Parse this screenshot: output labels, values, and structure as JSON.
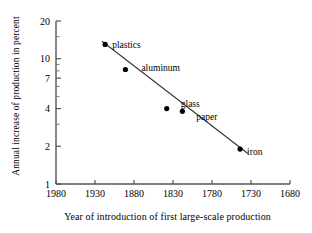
{
  "chart_data": {
    "type": "scatter",
    "title": "",
    "xlabel": "Year of introduction of first large-scale production",
    "ylabel": "Annual increase of production in percent",
    "xlim": [
      1980,
      1680
    ],
    "ylim": [
      1,
      20
    ],
    "yscale": "log",
    "xscale": "linear",
    "x_reversed": true,
    "grid": false,
    "legend": "none",
    "xticks": [
      "1980",
      "1930",
      "1880",
      "1830",
      "1780",
      "1730",
      "1680"
    ],
    "xtick_values": [
      1980,
      1930,
      1880,
      1830,
      1780,
      1730,
      1680
    ],
    "yticks": [
      "20",
      "10",
      "7",
      "4",
      "2",
      "1"
    ],
    "ytick_values": [
      20,
      10,
      7,
      4,
      2,
      1
    ],
    "points": [
      {
        "label": "plastics",
        "x": 1917,
        "y": 13.0
      },
      {
        "label": "aluminum",
        "x": 1891,
        "y": 8.2
      },
      {
        "label": "glass",
        "x": 1838,
        "y": 4.0
      },
      {
        "label": "paper",
        "x": 1818,
        "y": 3.8
      },
      {
        "label": "iron",
        "x": 1744,
        "y": 1.9
      }
    ],
    "trendline": {
      "x_start": 1921,
      "y_start": 13.8,
      "x_end": 1734,
      "y_end": 1.75
    },
    "annotations": [
      "plastics",
      "aluminum",
      "glass",
      "paper",
      "iron"
    ],
    "marker_color": "#000000",
    "line_color": "#3a3a3a",
    "axis_color": "#555555",
    "background": "#ffffff"
  },
  "axes": {
    "y_title": "Annual increase of production in percent",
    "x_title": "Year of introduction of first large-scale production"
  }
}
